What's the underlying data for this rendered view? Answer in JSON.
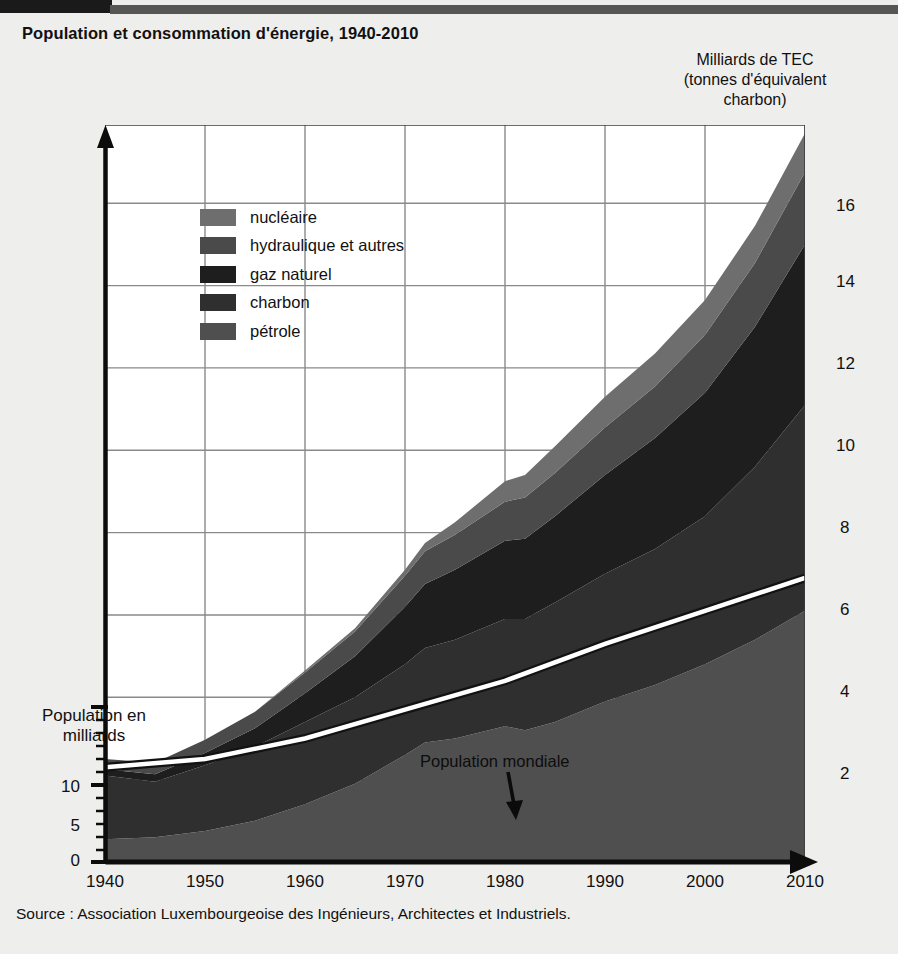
{
  "header": {
    "title": "Population et consommation d'énergie, 1940-2010",
    "unit_caption_line1": "Milliards de TEC",
    "unit_caption_line2": "(tonnes d'équivalent",
    "unit_caption_line3": "charbon)"
  },
  "footer": {
    "source": "Source :  Association Luxembourgeoise des Ingénieurs, Architectes et Industriels."
  },
  "left_axis": {
    "caption_line1": "Population en",
    "caption_line2": "milliards",
    "ticks": [
      "10",
      "5",
      "0"
    ]
  },
  "right_axis": {
    "ticks": [
      "16",
      "14",
      "12",
      "10",
      "8",
      "6",
      "4",
      "2"
    ]
  },
  "x_axis": {
    "ticks": [
      "1940",
      "1950",
      "1960",
      "1970",
      "1980",
      "1990",
      "2000",
      "2010"
    ]
  },
  "legend": {
    "items": [
      {
        "label": "nucléaire",
        "color": "#6e6e6e"
      },
      {
        "label": "hydraulique et autres",
        "color": "#4a4a4a"
      },
      {
        "label": "gaz naturel",
        "color": "#1e1e1e"
      },
      {
        "label": "charbon",
        "color": "#2f2f2f"
      },
      {
        "label": "pétrole",
        "color": "#4f4f4f"
      }
    ]
  },
  "annotation": {
    "population_line_label": "Population mondiale"
  },
  "chart_data": {
    "type": "area",
    "title": "Population et consommation d'énergie, 1940-2010",
    "subtitle": "",
    "xlabel": "",
    "ylabel": "Milliards de TEC (tonnes d'équivalent charbon)",
    "ylabel_left": "Population en milliards",
    "grid": true,
    "legend_position": "inside-top-left",
    "xlim": [
      1940,
      2010
    ],
    "ylim": [
      0,
      17.9
    ],
    "ylim_left": [
      0,
      17.9
    ],
    "x": [
      1940,
      1945,
      1950,
      1955,
      1960,
      1965,
      1970,
      1972,
      1975,
      1980,
      1982,
      1985,
      1990,
      1995,
      2000,
      2005,
      2010
    ],
    "stack_order": [
      "pétrole",
      "charbon",
      "gaz naturel",
      "hydraulique et autres",
      "nucléaire"
    ],
    "series": [
      {
        "name": "pétrole",
        "color": "#4f4f4f",
        "values": [
          0.55,
          0.6,
          0.75,
          1.0,
          1.4,
          1.9,
          2.6,
          2.9,
          3.0,
          3.3,
          3.2,
          3.4,
          3.9,
          4.3,
          4.8,
          5.4,
          6.1
        ]
      },
      {
        "name": "charbon",
        "color": "#2f2f2f",
        "values": [
          1.55,
          1.35,
          1.6,
          1.8,
          2.0,
          2.1,
          2.2,
          2.3,
          2.4,
          2.6,
          2.7,
          2.9,
          3.1,
          3.3,
          3.6,
          4.2,
          5.0
        ]
      },
      {
        "name": "gaz naturel",
        "color": "#1e1e1e",
        "values": [
          0.15,
          0.18,
          0.3,
          0.45,
          0.7,
          1.0,
          1.4,
          1.55,
          1.7,
          1.9,
          1.95,
          2.1,
          2.4,
          2.7,
          3.0,
          3.4,
          3.9
        ]
      },
      {
        "name": "hydraulique et autres",
        "color": "#4a4a4a",
        "values": [
          0.25,
          0.28,
          0.32,
          0.4,
          0.5,
          0.6,
          0.75,
          0.8,
          0.85,
          0.95,
          1.0,
          1.05,
          1.15,
          1.25,
          1.4,
          1.55,
          1.75
        ]
      },
      {
        "name": "nucléaire",
        "color": "#6e6e6e",
        "values": [
          0.0,
          0.0,
          0.0,
          0.0,
          0.05,
          0.08,
          0.15,
          0.2,
          0.3,
          0.5,
          0.55,
          0.65,
          0.75,
          0.8,
          0.85,
          0.9,
          0.95
        ]
      }
    ],
    "population_line": {
      "name": "Population mondiale",
      "axis": "left",
      "units": "milliards",
      "color": "#ffffff",
      "x": [
        1940,
        1950,
        1960,
        1970,
        1980,
        1990,
        2000,
        2010
      ],
      "values": [
        2.3,
        2.5,
        3.0,
        3.7,
        4.4,
        5.3,
        6.1,
        6.9
      ]
    },
    "totals": [
      2.5,
      2.41,
      2.97,
      3.65,
      4.65,
      5.68,
      7.1,
      7.75,
      8.25,
      9.25,
      9.4,
      10.1,
      11.3,
      12.35,
      13.65,
      15.45,
      17.7
    ]
  }
}
